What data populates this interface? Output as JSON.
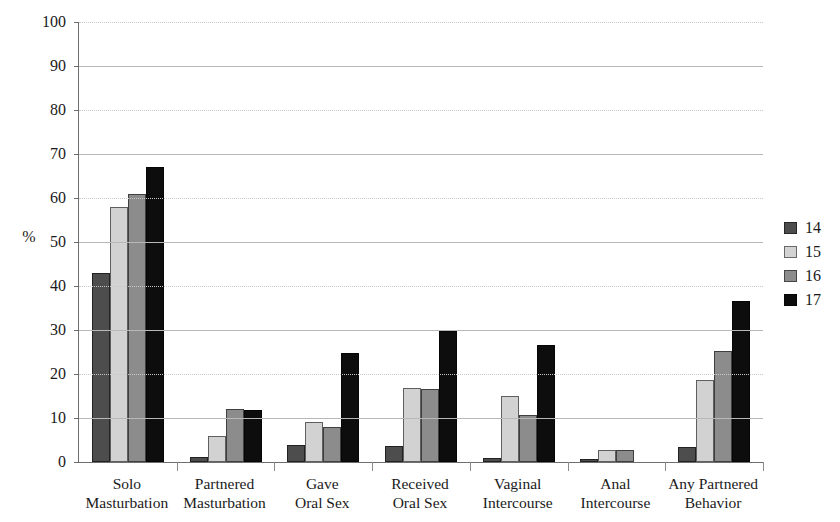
{
  "chart_data": {
    "type": "bar",
    "title": "",
    "subtitle": "",
    "xlabel": "",
    "ylabel": "%",
    "ylim": [
      0,
      100
    ],
    "ytick_step": 10,
    "yticks": [
      0,
      10,
      20,
      30,
      40,
      50,
      60,
      70,
      80,
      90,
      100
    ],
    "ytick_labels": [
      "0",
      "10",
      "20",
      "30",
      "40",
      "50",
      "60",
      "70",
      "80",
      "90",
      "100"
    ],
    "grid": true,
    "legend_position": "right",
    "categories": [
      "Solo Masturbation",
      "Partnered Masturbation",
      "Gave Oral Sex",
      "Received Oral Sex",
      "Vaginal Intercourse",
      "Anal Intercourse",
      "Any Partnered Behavior"
    ],
    "category_lines": [
      [
        "Solo",
        "Masturbation"
      ],
      [
        "Partnered",
        "Masturbation"
      ],
      [
        "Gave",
        "Oral Sex"
      ],
      [
        "Received",
        "Oral Sex"
      ],
      [
        "Vaginal",
        "Intercourse"
      ],
      [
        "Anal",
        "Intercourse"
      ],
      [
        "Any Partnered",
        "Behavior"
      ]
    ],
    "series": [
      {
        "name": "14",
        "color": "#4d4d4d",
        "values": [
          43.0,
          1.2,
          3.8,
          3.7,
          0.9,
          0.7,
          3.5
        ]
      },
      {
        "name": "15",
        "color": "#d2d2d2",
        "values": [
          58.0,
          6.0,
          9.0,
          16.8,
          14.9,
          2.8,
          18.7
        ]
      },
      {
        "name": "16",
        "color": "#8c8c8c",
        "values": [
          61.0,
          12.0,
          8.0,
          16.7,
          10.6,
          2.7,
          25.3
        ]
      },
      {
        "name": "17",
        "color": "#0d0d0d",
        "values": [
          67.0,
          11.8,
          24.7,
          29.7,
          26.5,
          0.0,
          36.5
        ]
      }
    ]
  },
  "legend": {
    "items": [
      {
        "label": "14",
        "color": "#4d4d4d"
      },
      {
        "label": "15",
        "color": "#d2d2d2"
      },
      {
        "label": "16",
        "color": "#8c8c8c"
      },
      {
        "label": "17",
        "color": "#0d0d0d"
      }
    ]
  },
  "axis": {
    "y_title": "%",
    "axis_line_color": "#6e6e6e",
    "gridline_color": "#b8b8b8"
  }
}
